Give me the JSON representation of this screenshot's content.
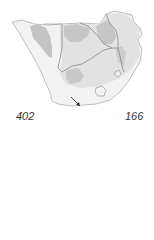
{
  "map": {
    "region": "Southern Africa",
    "colors": {
      "background": "#ffffff",
      "land": "#f2f2f2",
      "range_light": "#e2e2e2",
      "range_dark": "#c4c4c4",
      "border": "#8a8a8a",
      "coast": "#b0b0b0",
      "arrow": "#333333"
    },
    "arrow_icon": "arrow-down-right"
  },
  "labels": {
    "left_value": "402",
    "right_value": "166"
  }
}
